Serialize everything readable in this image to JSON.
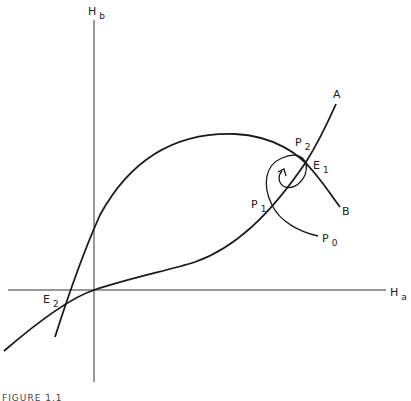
{
  "axes": {
    "y_label": {
      "main": "H",
      "sub": "b"
    },
    "x_label": {
      "main": "H",
      "sub": "a"
    }
  },
  "curves": {
    "curve_a_label": "A",
    "curve_b_label": "B"
  },
  "points": {
    "e1": {
      "main": "E",
      "sub": "1"
    },
    "e2": {
      "main": "E",
      "sub": "2"
    },
    "p0": {
      "main": "P",
      "sub": "0"
    },
    "p1": {
      "main": "P",
      "sub": "1"
    },
    "p2": {
      "main": "P",
      "sub": "2"
    }
  },
  "caption": "FIGURE 1.1",
  "colors": {
    "stroke": "#1a1a1a",
    "background": "#ffffff"
  }
}
